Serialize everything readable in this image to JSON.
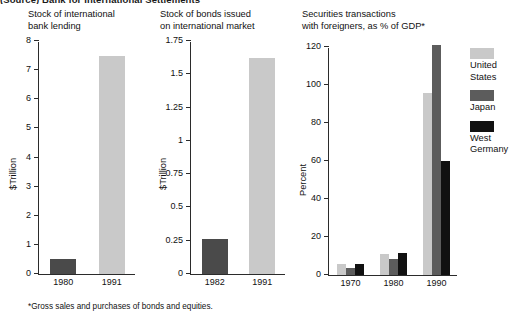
{
  "source_note": "(Source) Bank for International Settlements",
  "footnote": "*Gross sales and purchases of bonds and equities.",
  "colors": {
    "light_gray": "#c9c9c9",
    "dark_gray": "#4a4a4a",
    "mid_gray": "#5c5c5c",
    "black": "#111111",
    "axis": "#2b2b2b"
  },
  "panels": [
    {
      "id": "bank-lending",
      "title": "Stock of international\nbank lending",
      "chart_data": {
        "type": "bar",
        "title": "Stock of international bank lending",
        "xlabel": "",
        "ylabel": "$Trillion",
        "ylim": [
          0,
          8
        ],
        "yticks": [
          0,
          1,
          2,
          3,
          4,
          5,
          6,
          7,
          8
        ],
        "ytick_labels": [
          "0",
          "1",
          "2",
          "3",
          "4",
          "5",
          "6",
          "7",
          "8"
        ],
        "grid": false,
        "categories": [
          "1980",
          "1991"
        ],
        "values": [
          0.5,
          7.5
        ],
        "bar_colors": [
          "#4a4a4a",
          "#c9c9c9"
        ]
      }
    },
    {
      "id": "bonds-issued",
      "title": "Stock of bonds issued\non international market",
      "chart_data": {
        "type": "bar",
        "title": "Stock of bonds issued on international market",
        "xlabel": "",
        "ylabel": "$Trillion",
        "ylim": [
          0,
          1.75
        ],
        "yticks": [
          0,
          0.25,
          0.5,
          0.75,
          1,
          1.25,
          1.5,
          1.75
        ],
        "ytick_labels": [
          "0",
          "0.25",
          "0.5",
          "0.75",
          "1",
          "1.25",
          "1.5",
          "1.75"
        ],
        "grid": false,
        "categories": [
          "1982",
          "1991"
        ],
        "values": [
          0.26,
          1.62
        ],
        "bar_colors": [
          "#4a4a4a",
          "#c9c9c9"
        ]
      }
    },
    {
      "id": "securities-transactions",
      "title": "Securities transactions\nwith foreigners, as % of GDP*",
      "chart_data": {
        "type": "bar",
        "title": "Securities transactions with foreigners, as % of GDP*",
        "xlabel": "",
        "ylabel": "Percent",
        "ylim": [
          0,
          120
        ],
        "yticks": [
          0,
          20,
          40,
          60,
          80,
          100,
          120
        ],
        "ytick_labels": [
          "0",
          "20",
          "40",
          "60",
          "80",
          "100",
          "120"
        ],
        "grid": false,
        "legend_position": "right",
        "categories": [
          "1970",
          "1980",
          "1990"
        ],
        "series": [
          {
            "name": "United States",
            "label": "United\nStates",
            "color": "#c9c9c9",
            "values": [
              6,
              11,
              96
            ]
          },
          {
            "name": "Japan",
            "label": "Japan",
            "color": "#5c5c5c",
            "values": [
              3.5,
              8.5,
              121
            ]
          },
          {
            "name": "West Germany",
            "label": "West\nGermany",
            "color": "#111111",
            "values": [
              6,
              11.5,
              60
            ]
          }
        ]
      }
    }
  ]
}
